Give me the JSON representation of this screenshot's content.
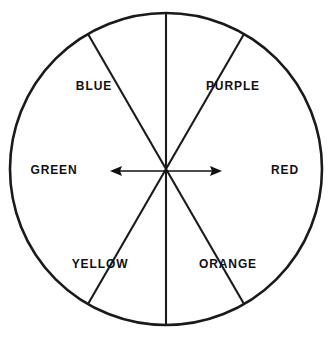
{
  "diagram": {
    "type": "pie",
    "stroke_color": "#1a1a1a",
    "fill_color": "#ffffff",
    "label_color": "#111111",
    "circle": {
      "center_x": 166,
      "center_y": 169,
      "radius": 156,
      "stroke_width": 2.6
    },
    "sectors": [
      {
        "label": "PURPLE",
        "start_angle_deg": 270,
        "end_angle_deg": 330,
        "label_x": 233,
        "label_y": 87
      },
      {
        "label": "RED",
        "start_angle_deg": 330,
        "end_angle_deg": 30,
        "label_x": 285,
        "label_y": 171
      },
      {
        "label": "ORANGE",
        "start_angle_deg": 30,
        "end_angle_deg": 90,
        "label_x": 228,
        "label_y": 265
      },
      {
        "label": "YELLOW",
        "start_angle_deg": 90,
        "end_angle_deg": 150,
        "label_x": 100,
        "label_y": 265
      },
      {
        "label": "GREEN",
        "start_angle_deg": 150,
        "end_angle_deg": 210,
        "label_x": 54,
        "label_y": 171
      },
      {
        "label": "BLUE",
        "start_angle_deg": 210,
        "end_angle_deg": 270,
        "label_x": 94,
        "label_y": 87
      }
    ],
    "divider_lines": [
      {
        "name": "vertical-diameter",
        "x1": 166,
        "y1": 13,
        "x2": 166,
        "y2": 325
      },
      {
        "name": "diagonal-diameter-nw-se",
        "x1": 31,
        "y1": 91,
        "x2": 301,
        "y2": 247
      },
      {
        "name": "diagonal-diameter-ne-sw",
        "x1": 301,
        "y1": 91,
        "x2": 31,
        "y2": 247
      }
    ],
    "arrow": {
      "name": "horizontal-double-arrow",
      "x_left_tip": 110,
      "x_right_tip": 222,
      "y": 171,
      "stroke_width": 1.6,
      "head_length": 11,
      "head_width": 9
    }
  }
}
